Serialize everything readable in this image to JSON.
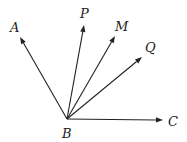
{
  "diagram": {
    "vertex": {
      "name": "B",
      "x": 67,
      "y": 119,
      "label_x": 62,
      "label_y": 138
    },
    "rays": [
      {
        "name": "A",
        "tip_x": 20,
        "tip_y": 37,
        "label_x": 10,
        "label_y": 32
      },
      {
        "name": "P",
        "tip_x": 84,
        "tip_y": 25,
        "label_x": 80,
        "label_y": 18
      },
      {
        "name": "M",
        "tip_x": 115,
        "tip_y": 36,
        "label_x": 115,
        "label_y": 31
      },
      {
        "name": "Q",
        "tip_x": 142,
        "tip_y": 57,
        "label_x": 145,
        "label_y": 52
      },
      {
        "name": "C",
        "tip_x": 163,
        "tip_y": 120,
        "label_x": 168,
        "label_y": 126
      }
    ],
    "colors": {
      "stroke": "#222222",
      "background": "#ffffff"
    }
  }
}
